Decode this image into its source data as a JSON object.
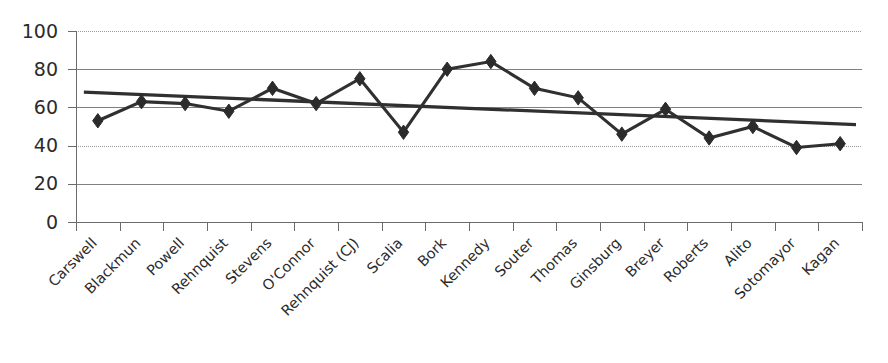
{
  "chart_data": {
    "type": "line",
    "title": "",
    "subtitle": "",
    "xlabel": "",
    "ylabel": "",
    "ylim": [
      0,
      100
    ],
    "yticks": [
      0,
      20,
      40,
      60,
      80,
      100
    ],
    "grid": true,
    "legend": "none",
    "categories": [
      "Carswell",
      "Blackmun",
      "Powell",
      "Rehnquist",
      "Stevens",
      "O'Connor",
      "Rehnquist (CJ)",
      "Scalia",
      "Bork",
      "Kennedy",
      "Souter",
      "Thomas",
      "Ginsburg",
      "Breyer",
      "Roberts",
      "Alito",
      "Sotomayor",
      "Kagan"
    ],
    "series": [
      {
        "name": "Support",
        "marker": "diamond",
        "values": [
          53,
          63,
          62,
          58,
          70,
          62,
          75,
          47,
          80,
          84,
          70,
          65,
          46,
          59,
          44,
          50,
          39,
          41
        ]
      },
      {
        "name": "Linear trend",
        "marker": "none",
        "trend": true,
        "start_value": 68,
        "end_value": 51
      }
    ],
    "colors": {
      "series_line": "#303030",
      "trend_line": "#303030",
      "marker": "#2b2b2b",
      "gridline": "#808080",
      "axis": "#6b6b6b",
      "background": "#ffffff",
      "text": "#2b2b2b"
    },
    "axis_label_rotation": -45
  }
}
